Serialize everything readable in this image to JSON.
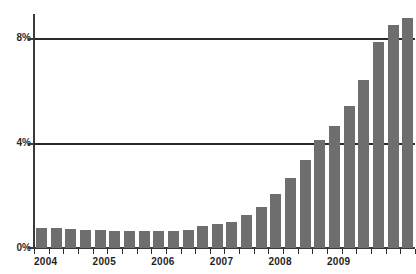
{
  "chart_data": {
    "type": "bar",
    "title": "",
    "xlabel": "",
    "ylabel": "",
    "ylim": [
      0,
      9.1
    ],
    "grid": true,
    "legend": null,
    "y_ticks": [
      "0%",
      "4%",
      "8%"
    ],
    "y_tick_values": [
      0,
      4,
      8
    ],
    "x_tick_labels": [
      "2004",
      "2005",
      "2006",
      "2007",
      "2008",
      "2009"
    ],
    "x_tick_label_positions": [
      0,
      4,
      8,
      12,
      16,
      20
    ],
    "categories": [
      "2004 Q1",
      "2004 Q2",
      "2004 Q3",
      "2004 Q4",
      "2005 Q1",
      "2005 Q2",
      "2005 Q3",
      "2005 Q4",
      "2006 Q1",
      "2006 Q2",
      "2006 Q3",
      "2006 Q4",
      "2007 Q1",
      "2007 Q2",
      "2007 Q3",
      "2007 Q4",
      "2008 Q1",
      "2008 Q2",
      "2008 Q3",
      "2008 Q4",
      "2009 Q1",
      "2009 Q2",
      "2009 Q3",
      "2009 Q4",
      "2010 Q1"
    ],
    "values": [
      0.76,
      0.78,
      0.74,
      0.67,
      0.68,
      0.65,
      0.66,
      0.64,
      0.64,
      0.63,
      0.7,
      0.85,
      0.9,
      1.0,
      1.25,
      1.55,
      2.05,
      2.65,
      3.35,
      4.1,
      4.65,
      5.4,
      6.4,
      7.85,
      8.5
    ],
    "series": [
      {
        "name": "rate",
        "color": "#6e6e6e",
        "values": [
          0.76,
          0.78,
          0.74,
          0.67,
          0.68,
          0.65,
          0.66,
          0.64,
          0.64,
          0.63,
          0.7,
          0.85,
          0.9,
          1.0,
          1.25,
          1.55,
          2.05,
          2.65,
          3.35,
          4.1,
          4.65,
          5.4,
          6.4,
          7.85,
          8.5
        ]
      }
    ],
    "extra_bar": {
      "label": "2010 Q2",
      "value": 8.75
    },
    "colors": {
      "bar": "#6e6e6e",
      "axis": "#3a3a3a",
      "gridline": "#2b2b2b",
      "text": "#1f1f1f",
      "background": "#ffffff"
    }
  },
  "axis": {
    "y_labels": [
      "8%",
      "4%",
      "0%"
    ],
    "x_labels": [
      "2004",
      "2005",
      "2006",
      "2007",
      "2008",
      "2009"
    ]
  },
  "title": {
    "text": ""
  }
}
